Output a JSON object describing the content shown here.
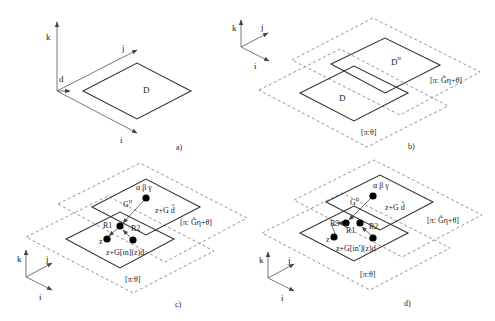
{
  "figure": {
    "panels": [
      {
        "id": "a",
        "caption": "a)",
        "axes": {
          "k": "k",
          "j": "j",
          "i": "i",
          "d": "d"
        },
        "domains": [
          {
            "label": "D"
          }
        ]
      },
      {
        "id": "b",
        "caption": "b)",
        "axes": {
          "k": "k",
          "j": "j",
          "i": "i"
        },
        "domains": [
          {
            "label": "D"
          },
          {
            "label": "D",
            "superscript": "tr"
          }
        ],
        "planes": [
          {
            "label": "[π:θ]"
          },
          {
            "label": "[π: Ĝη+θ]"
          }
        ]
      },
      {
        "id": "c",
        "caption": "c)",
        "axes": {
          "k": "k",
          "j": "j",
          "i": "i"
        },
        "planes": [
          {
            "label": "[π:θ]"
          },
          {
            "label": "[π: Ĝη+θ]"
          }
        ],
        "points": {
          "top": "α β γ",
          "gtr_base": "G",
          "gtr_sup": "tr",
          "upper_expr": "z+G d̂",
          "r1": "R1",
          "r2": "R2",
          "z": "z",
          "lower_expr": "z+G[in](z)d"
        }
      },
      {
        "id": "d",
        "caption": "d)",
        "axes": {
          "k": "k",
          "j": "j",
          "i": "i"
        },
        "planes": [
          {
            "label": "[π:θ]"
          },
          {
            "label": "[π: Ĝη+θ]"
          }
        ],
        "points": {
          "top": "α β γ",
          "gtr_base": "G",
          "gtr_sup": "tr",
          "upper_expr": "z+G d̂",
          "r3": "R3",
          "r1": "R1",
          "r2": "R2",
          "z": "z",
          "lower_expr": "z+G[in'](z)d"
        }
      }
    ]
  }
}
